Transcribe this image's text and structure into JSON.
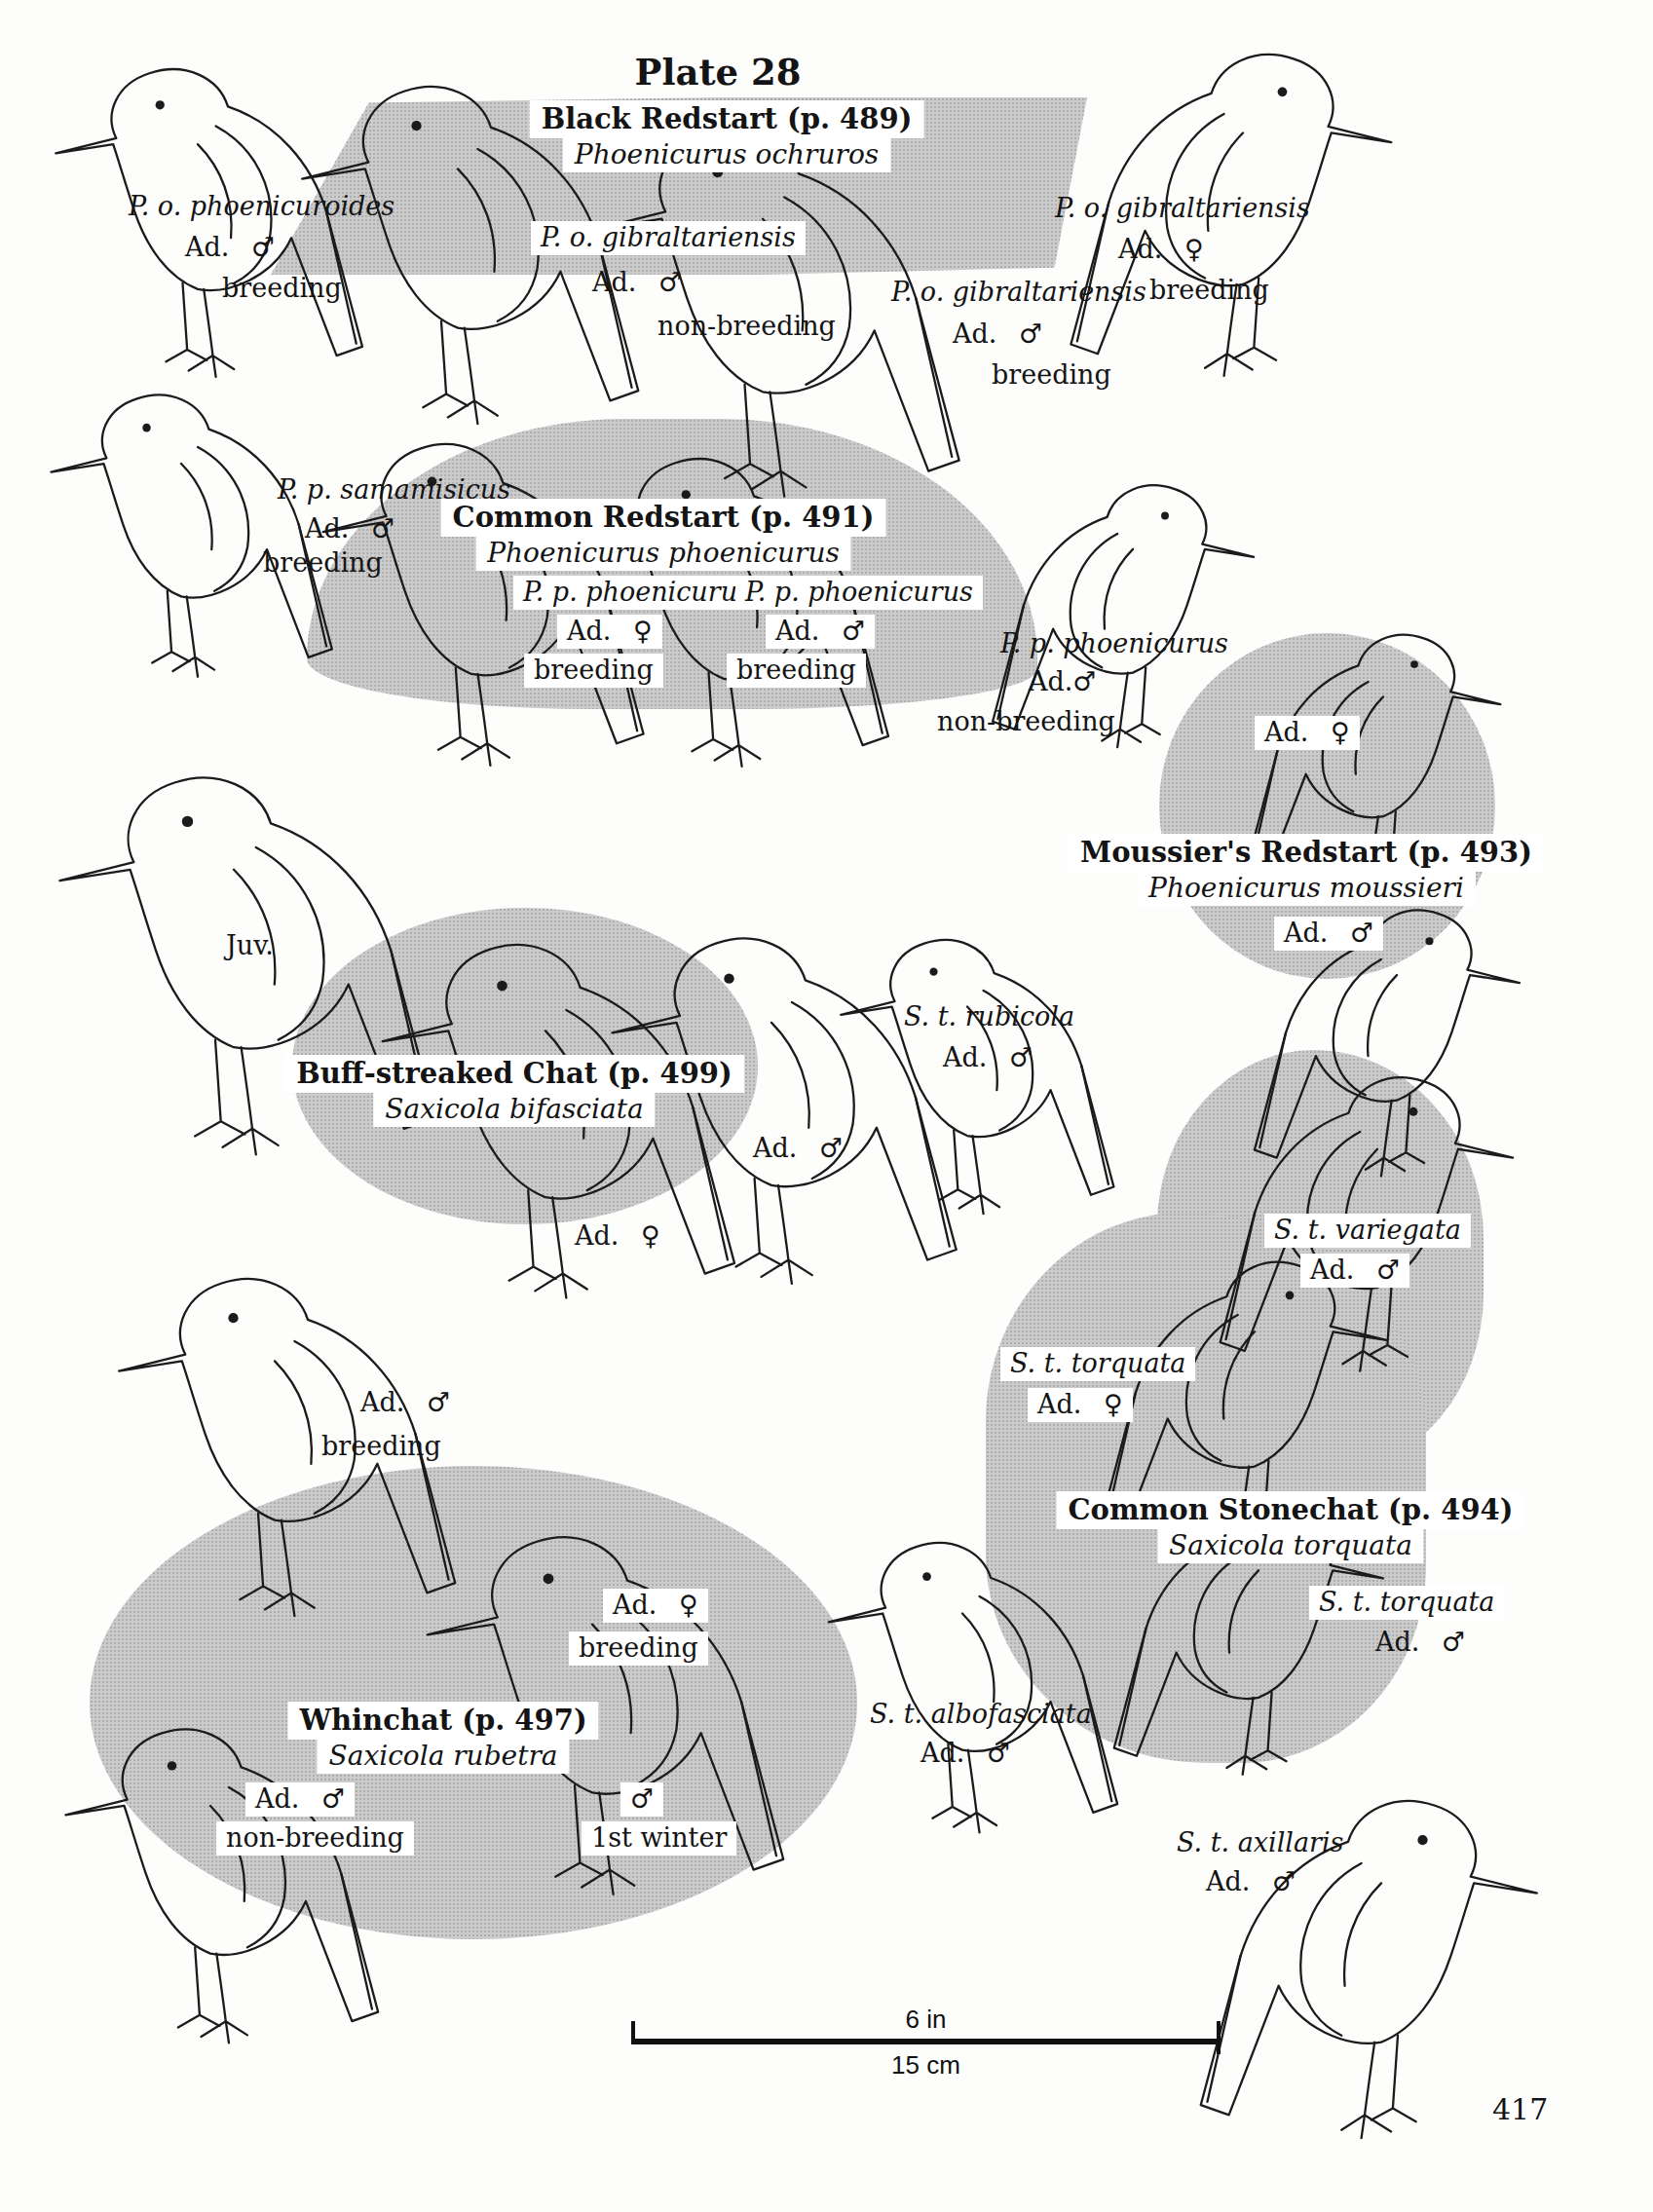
{
  "plate": {
    "title": "Plate 28",
    "page_number": "417"
  },
  "scale_bar": {
    "inches": "6 in",
    "centimeters": "15 cm"
  },
  "species": {
    "black_redstart": {
      "common_name": "Black Redstart (p. 489)",
      "scientific_name": "Phoenicurus ochruros"
    },
    "common_redstart": {
      "common_name": "Common Redstart (p. 491)",
      "scientific_name": "Phoenicurus phoenicurus"
    },
    "moussiers_redstart": {
      "common_name": "Moussier's Redstart (p. 493)",
      "scientific_name": "Phoenicurus moussieri"
    },
    "buff_streaked_chat": {
      "common_name": "Buff-streaked Chat (p. 499)",
      "scientific_name": "Saxicola bifasciata"
    },
    "common_stonechat": {
      "common_name": "Common Stonechat (p. 494)",
      "scientific_name": "Saxicola torquata"
    },
    "whinchat": {
      "common_name": "Whinchat (p. 497)",
      "scientific_name": "Saxicola rubetra"
    }
  },
  "labels": {
    "po_phoenicuroides": {
      "subspecies": "P. o. phoenicuroides",
      "age_sex": "Ad. ♂",
      "status": "breeding"
    },
    "po_gibraltariensis_nb": {
      "subspecies": "P. o. gibraltariensis",
      "age_sex": "Ad. ♂",
      "status": "non-breeding"
    },
    "po_gibraltariensis_f": {
      "subspecies": "P. o. gibraltariensis",
      "age_sex": "Ad. ♀",
      "status": "breeding"
    },
    "po_gibraltariensis_m": {
      "subspecies": "P. o. gibraltariensis",
      "age_sex": "Ad. ♂",
      "status": "breeding"
    },
    "pp_samamisicus": {
      "subspecies": "P. p. samamisicus",
      "age_sex": "Ad. ♂",
      "status": "breeding"
    },
    "pp_phoenicurus_f": {
      "subspecies": "P. p. phoenicurus",
      "age_sex": "Ad. ♀",
      "status": "breeding"
    },
    "pp_phoenicurus_m": {
      "subspecies": "P. p. phoenicurus",
      "age_sex": "Ad. ♂",
      "status": "breeding"
    },
    "pp_phoenicurus_nb": {
      "subspecies": "P. p. phoenicurus",
      "age_sex": "Ad.♂",
      "status": "non-breeding"
    },
    "moussiers_f": {
      "age_sex": "Ad. ♀"
    },
    "moussiers_m": {
      "age_sex": "Ad. ♂"
    },
    "juvenile": {
      "age_sex": "Juv."
    },
    "buff_streaked_m": {
      "age_sex": "Ad. ♂"
    },
    "buff_streaked_f": {
      "age_sex": "Ad. ♀"
    },
    "st_rubicola": {
      "subspecies": "S. t. rubicola",
      "age_sex": "Ad. ♂"
    },
    "st_variegata": {
      "subspecies": "S. t. variegata",
      "age_sex": "Ad. ♂"
    },
    "st_torquata_f": {
      "subspecies": "S. t. torquata",
      "age_sex": "Ad. ♀"
    },
    "st_torquata_m": {
      "subspecies": "S. t. torquata",
      "age_sex": "Ad. ♂"
    },
    "st_albofasciata": {
      "subspecies": "S. t. albofasciata",
      "age_sex": "Ad. ♂"
    },
    "st_axillaris": {
      "subspecies": "S. t. axillaris",
      "age_sex": "Ad. ♂"
    },
    "whinchat_breeding_m": {
      "age_sex": "Ad. ♂",
      "status": "breeding"
    },
    "whinchat_breeding_f": {
      "age_sex": "Ad. ♀",
      "status": "breeding"
    },
    "whinchat_nonbreeding_m": {
      "age_sex": "Ad. ♂",
      "status": "non-breeding"
    },
    "whinchat_first_winter": {
      "age_sex": "♂",
      "status": "1st winter"
    }
  }
}
